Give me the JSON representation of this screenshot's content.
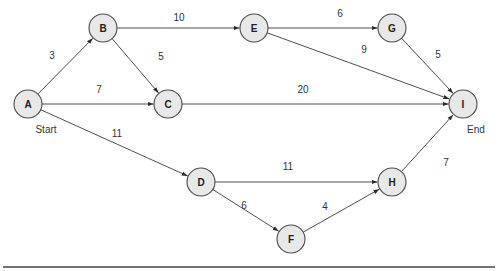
{
  "diagram": {
    "type": "network-activity-diagram",
    "node_radius": 14,
    "colors": {
      "node_fill": "#e8e8e8",
      "node_stroke": "#4a4a4a",
      "edge": "#3a3a3a",
      "text": "#333333"
    },
    "nodes": [
      {
        "id": "A",
        "label": "A",
        "x": 28,
        "y": 104
      },
      {
        "id": "B",
        "label": "B",
        "x": 103,
        "y": 28
      },
      {
        "id": "C",
        "label": "C",
        "x": 168,
        "y": 104
      },
      {
        "id": "D",
        "label": "D",
        "x": 201,
        "y": 182
      },
      {
        "id": "E",
        "label": "E",
        "x": 254,
        "y": 28
      },
      {
        "id": "F",
        "label": "F",
        "x": 291,
        "y": 239
      },
      {
        "id": "G",
        "label": "G",
        "x": 392,
        "y": 28
      },
      {
        "id": "H",
        "label": "H",
        "x": 392,
        "y": 182
      },
      {
        "id": "I",
        "label": "I",
        "x": 463,
        "y": 104
      }
    ],
    "edges": [
      {
        "from": "A",
        "to": "B",
        "weight": "3",
        "lx": 52,
        "ly": 55
      },
      {
        "from": "A",
        "to": "C",
        "weight": "7",
        "lx": 99,
        "ly": 89
      },
      {
        "from": "A",
        "to": "D",
        "weight": "11",
        "lx": 117,
        "ly": 133
      },
      {
        "from": "B",
        "to": "E",
        "weight": "10",
        "lx": 179,
        "ly": 17
      },
      {
        "from": "B",
        "to": "C",
        "weight": "5",
        "lx": 161,
        "ly": 56
      },
      {
        "from": "C",
        "to": "I",
        "weight": "20",
        "lx": 303,
        "ly": 89
      },
      {
        "from": "E",
        "to": "G",
        "weight": "6",
        "lx": 340,
        "ly": 13
      },
      {
        "from": "E",
        "to": "I",
        "weight": "9",
        "lx": 364,
        "ly": 49
      },
      {
        "from": "G",
        "to": "I",
        "weight": "5",
        "lx": 438,
        "ly": 54
      },
      {
        "from": "D",
        "to": "H",
        "weight": "11",
        "lx": 288,
        "ly": 166
      },
      {
        "from": "D",
        "to": "F",
        "weight": "6",
        "lx": 244,
        "ly": 205
      },
      {
        "from": "F",
        "to": "H",
        "weight": "4",
        "lx": 325,
        "ly": 206
      },
      {
        "from": "H",
        "to": "I",
        "weight": "7",
        "lx": 446,
        "ly": 162
      }
    ],
    "terminals": {
      "start": {
        "label": "Start",
        "x": 46,
        "y": 129
      },
      "end": {
        "label": "End",
        "x": 476,
        "y": 129
      }
    }
  }
}
